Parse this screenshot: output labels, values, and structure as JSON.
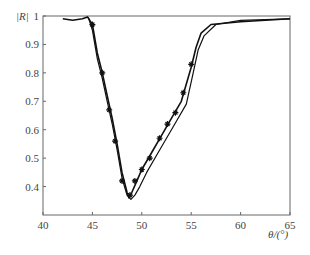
{
  "chart_data": {
    "type": "line",
    "title": "",
    "xlabel": "θ/(°)",
    "ylabel": "|R|",
    "xlim": [
      40,
      65
    ],
    "ylim": [
      0.3,
      1.0
    ],
    "xticks": [
      40,
      45,
      50,
      55,
      60,
      65
    ],
    "yticks": [
      0.4,
      0.5,
      0.6,
      0.7,
      0.8,
      0.9,
      1
    ],
    "grid": false,
    "legend": null,
    "series": [
      {
        "name": "curve-1",
        "marker": "star",
        "x": [
          42,
          43,
          44,
          44.5,
          45,
          45.5,
          46,
          46.5,
          47,
          47.5,
          48,
          48.5,
          48.7,
          49,
          49.5,
          50,
          51,
          52,
          53,
          54,
          55,
          55.5,
          56,
          57,
          60,
          65
        ],
        "y": [
          0.99,
          0.985,
          0.99,
          0.997,
          0.97,
          0.87,
          0.8,
          0.72,
          0.64,
          0.55,
          0.45,
          0.38,
          0.36,
          0.38,
          0.42,
          0.46,
          0.52,
          0.58,
          0.64,
          0.7,
          0.82,
          0.89,
          0.94,
          0.97,
          0.98,
          0.99
        ]
      },
      {
        "name": "curve-2",
        "marker": "dot",
        "x": [
          44.6,
          45,
          45.5,
          46,
          46.5,
          47,
          47.5,
          48,
          48.5,
          48.9,
          49.3,
          49.8,
          50.5,
          51.5,
          52.5,
          53.5,
          54.5,
          55.2,
          55.7,
          56.3,
          57.5,
          60,
          65
        ],
        "y": [
          0.995,
          0.95,
          0.85,
          0.78,
          0.7,
          0.62,
          0.53,
          0.43,
          0.37,
          0.355,
          0.37,
          0.4,
          0.45,
          0.51,
          0.57,
          0.63,
          0.69,
          0.8,
          0.88,
          0.93,
          0.97,
          0.985,
          0.99
        ]
      }
    ],
    "markers_curve1": [
      [
        45,
        0.97
      ],
      [
        46,
        0.8
      ],
      [
        46.7,
        0.67
      ],
      [
        47.3,
        0.56
      ],
      [
        48,
        0.42
      ],
      [
        48.8,
        0.37
      ],
      [
        49.3,
        0.42
      ],
      [
        50,
        0.46
      ],
      [
        50.8,
        0.5
      ],
      [
        51.8,
        0.57
      ],
      [
        52.6,
        0.62
      ],
      [
        53.4,
        0.66
      ],
      [
        54.2,
        0.73
      ],
      [
        55,
        0.83
      ]
    ]
  },
  "axes": {
    "ylabel": "|R|",
    "xlabel": "θ/(°)",
    "xtick_labels": [
      "40",
      "45",
      "50",
      "55",
      "60",
      "65"
    ],
    "ytick_labels": [
      "0.4",
      "0.5",
      "0.6",
      "0.7",
      "0.8",
      "0.9",
      "1"
    ]
  }
}
